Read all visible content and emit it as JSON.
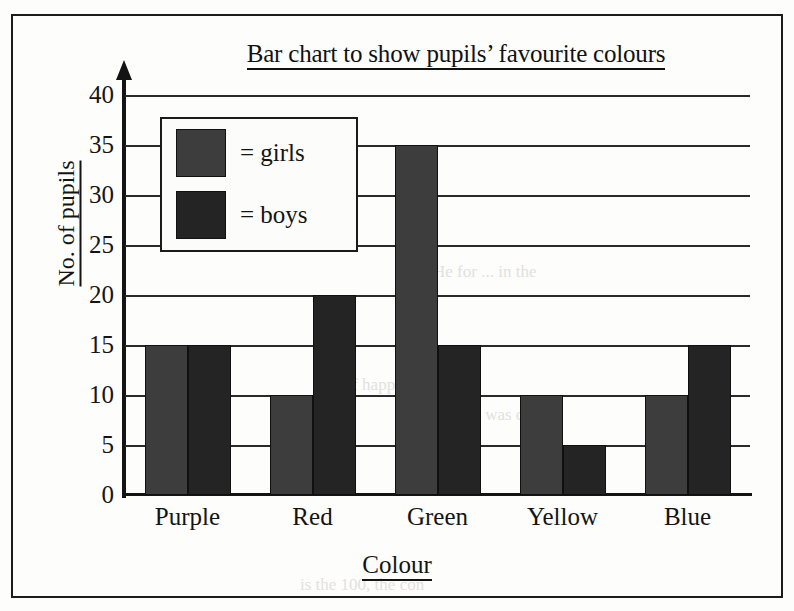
{
  "chart_data": {
    "type": "bar",
    "title": "Bar chart to show pupils’ favourite colours",
    "xlabel": "Colour",
    "ylabel": "No. of pupils",
    "categories": [
      "Purple",
      "Red",
      "Green",
      "Yellow",
      "Blue"
    ],
    "series": [
      {
        "name": "= girls",
        "key": "girls",
        "color": "#3d3d3d",
        "values": [
          15,
          10,
          35,
          10,
          10
        ]
      },
      {
        "name": "= boys",
        "key": "boys",
        "color": "#242424",
        "values": [
          15,
          20,
          15,
          5,
          15
        ]
      }
    ],
    "ylim": [
      0,
      40
    ],
    "ytick_labels": [
      "40",
      "35",
      "30",
      "25",
      "20",
      "15",
      "10",
      "5",
      "0"
    ],
    "ytick_values": [
      40,
      35,
      30,
      25,
      20,
      15,
      10,
      5,
      0
    ],
    "grid": true,
    "grid_axis": "y",
    "legend_position": "upper-left-inside",
    "title_underlined": true,
    "axis_labels_underlined": true,
    "y_axis_has_arrow": true
  },
  "legend": {
    "items": [
      {
        "label": "= girls",
        "color": "#3d3d3d"
      },
      {
        "label": "= boys",
        "color": "#242424"
      }
    ]
  },
  "colors": {
    "girls": "#3d3d3d",
    "boys": "#242424",
    "axis": "#141414",
    "grid": "#2a2a2a",
    "frame": "#1c1c1c",
    "page": "#fdfdfc"
  },
  "ghost_text": {
    "line1": "lear. He for ... in the",
    "line2": "ll of happens ... tal.",
    "line3": "no. 25 as was con",
    "line4": "is the 100, the con"
  }
}
